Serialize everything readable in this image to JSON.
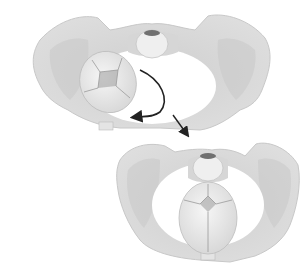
{
  "figure": {
    "panels": [
      {
        "id": "before-rotation",
        "head_orientation": "oblique"
      },
      {
        "id": "after-rotation",
        "head_orientation": "anteroposterior"
      }
    ],
    "colors": {
      "background": "#ffffff",
      "bone": "#d9d9d9",
      "bone_shade": "#c4c4c4",
      "bone_light": "#ececec",
      "head": "#e8e8e8",
      "fontanelle": "#9a9a9a",
      "sacrum_dark": "#707070",
      "arrow": "#222222"
    }
  }
}
